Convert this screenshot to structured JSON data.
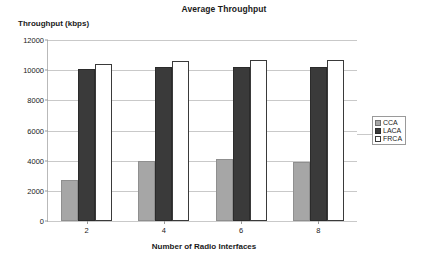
{
  "chart_data": {
    "type": "bar",
    "title": "Average Throughput",
    "xlabel": "Number of Radio Interfaces",
    "ylabel": "Throughput (kbps)",
    "categories": [
      "2",
      "4",
      "6",
      "8"
    ],
    "yticks": [
      0,
      2000,
      4000,
      6000,
      8000,
      10000,
      12000
    ],
    "ylim": [
      0,
      12000
    ],
    "grid": true,
    "legend_position": "right",
    "series": [
      {
        "name": "CCA",
        "color": "#a6a6a6",
        "values": [
          2750,
          4000,
          4100,
          3900
        ]
      },
      {
        "name": "LACA",
        "color": "#3a3a3a",
        "values": [
          10100,
          10200,
          10200,
          10200
        ]
      },
      {
        "name": "FRCA",
        "color": "#ffffff",
        "values": [
          10400,
          10600,
          10650,
          10700
        ]
      }
    ]
  }
}
